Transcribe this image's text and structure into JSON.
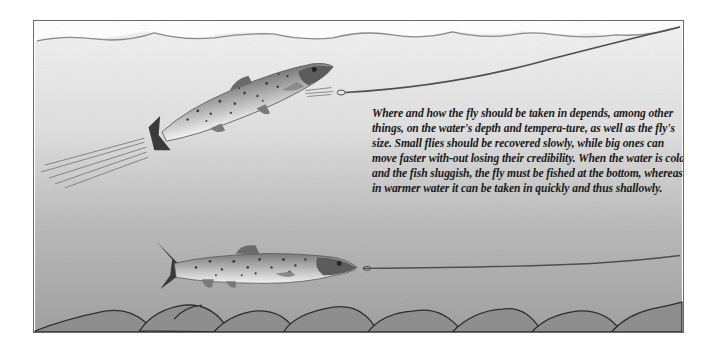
{
  "illustration": {
    "subject": "two-salmon-underwater-fly-fishing",
    "colors": {
      "water_top": "#efefef",
      "water_bottom": "#9a9a9a",
      "surface_line": "#8a8a8a",
      "fishing_line": "#555555",
      "frame_border": "#6a6a6a",
      "rocks": "#8e8e8e"
    },
    "fish": [
      {
        "name": "upper-salmon",
        "position": "upper-left",
        "taking_fly": "near surface"
      },
      {
        "name": "lower-salmon",
        "position": "lower-middle",
        "taking_fly": "near bottom"
      }
    ]
  },
  "caption": {
    "text": "Where and how the fly should be taken in depends, among other things, on the water's depth and tempera-ture, as well as the fly's size. Small flies should be recovered slowly, while big ones can move faster with-out losing their credibility. When the water is cold and the fish sluggish, the fly must be fished at the bottom, whereas in warmer water it can be taken in quickly and thus shallowly."
  }
}
